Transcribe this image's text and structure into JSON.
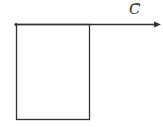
{
  "diagram": {
    "rectangle": {
      "x": 16,
      "y": 24,
      "width": 74,
      "height": 96,
      "stroke": "#333333"
    },
    "vector": {
      "x1": 16,
      "y1": 24,
      "x2": 160,
      "y2": 24,
      "stroke": "#333333"
    },
    "vector_label": "C",
    "vector_label_arrow": "→"
  }
}
